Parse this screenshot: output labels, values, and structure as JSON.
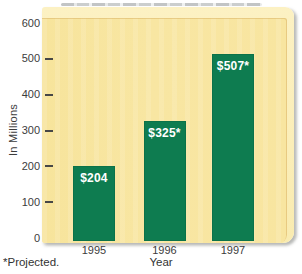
{
  "chart_data": {
    "type": "bar",
    "title": "",
    "categories": [
      "1995",
      "1996",
      "1997"
    ],
    "values": [
      204,
      325,
      507
    ],
    "bar_labels": [
      "$204",
      "$325*",
      "$507*"
    ],
    "xlabel": "Year",
    "ylabel": "In Millions",
    "footnote": "*Projected.",
    "ylim": [
      0,
      600
    ],
    "yticks": [
      0,
      100,
      200,
      300,
      400,
      500,
      600
    ],
    "grid": false,
    "legend": "none",
    "projected_years": [
      "1996",
      "1997"
    ],
    "colors": {
      "bar": "#0e7c50",
      "bar_label": "#ffffff",
      "panel_face": "#f8e6a2",
      "panel_bevel": "#fcf1c3",
      "axis_text": "#3c3c3c"
    }
  }
}
